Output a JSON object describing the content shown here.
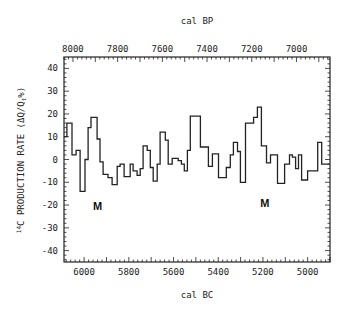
{
  "chart_data": {
    "type": "line",
    "style": "step",
    "title": "",
    "xlabel": "cal BC",
    "x2label": "cal BP",
    "ylabel": "14C PRODUCTION RATE (ΔQ/Qₜ%)",
    "ylabel_parts": {
      "sup": "14",
      "main": "C PRODUCTION RATE (ΔQ/Q",
      "sub": "t",
      "end": "%)"
    },
    "xlim": [
      6090,
      4900
    ],
    "ylim": [
      -45,
      45
    ],
    "x_ticks": [
      6000,
      5800,
      5600,
      5400,
      5200,
      5000
    ],
    "x_tick_labels": [
      "6000",
      "5800",
      "5600",
      "5400",
      "5200",
      "5000"
    ],
    "x2_ticks_bp": [
      8000,
      7800,
      7600,
      7400,
      7200,
      7000
    ],
    "x2_tick_labels": [
      "8000",
      "7800",
      "7600",
      "7400",
      "7200",
      "7000"
    ],
    "y_ticks": [
      40,
      30,
      20,
      10,
      0,
      -10,
      -20,
      -30,
      -40
    ],
    "y_tick_labels": [
      "40",
      "30",
      "20",
      "10",
      "0",
      "-10",
      "-20",
      "-30",
      "-40"
    ],
    "grid": false,
    "legend": null,
    "series": [
      {
        "name": "14C production rate",
        "x_start": [
          6090,
          6077,
          6054,
          6036,
          6018,
          5996,
          5982,
          5969,
          5942,
          5929,
          5915,
          5893,
          5875,
          5852,
          5839,
          5821,
          5794,
          5781,
          5763,
          5749,
          5736,
          5718,
          5704,
          5691,
          5673,
          5660,
          5637,
          5624,
          5606,
          5579,
          5565,
          5552,
          5538,
          5525,
          5480,
          5444,
          5426,
          5399,
          5364,
          5346,
          5332,
          5314,
          5301,
          5278,
          5242,
          5225,
          5207,
          5184,
          5166,
          5135,
          5103,
          5081,
          5068,
          5054,
          5041,
          5027,
          5000,
          4955,
          4937
        ],
        "values": [
          10,
          16,
          2,
          4,
          -14,
          0,
          14,
          18.5,
          9,
          -1,
          -6.5,
          -8,
          -11,
          -3,
          -2,
          -7.5,
          -2,
          -5,
          -7,
          -4,
          6,
          4,
          -3.5,
          -9.5,
          -2,
          12,
          8.5,
          -2,
          0.5,
          -0.5,
          -2,
          -5,
          4,
          19,
          5.5,
          -3,
          2.5,
          -8,
          -3.5,
          2,
          7.5,
          3.5,
          -10,
          16,
          18.5,
          23,
          6,
          -1.5,
          2,
          -10.5,
          -2,
          2,
          1,
          -4,
          2,
          -9,
          -5,
          7.5,
          -2
        ],
        "x_end": 4902
      }
    ],
    "annotations": [
      {
        "text": "M",
        "x": 5940,
        "y": -22
      },
      {
        "text": "M",
        "x": 5192,
        "y": -21
      }
    ]
  }
}
